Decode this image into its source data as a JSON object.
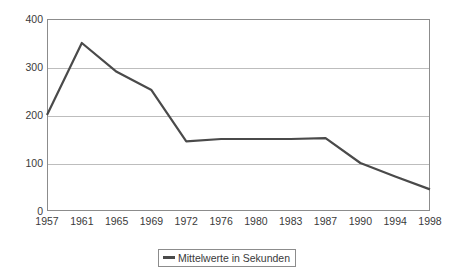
{
  "chart_data": {
    "type": "line",
    "title": "",
    "subtitle": "",
    "xlabel": "",
    "ylabel": "",
    "categories": [
      "1957",
      "1961",
      "1965",
      "1969",
      "1972",
      "1976",
      "1980",
      "1983",
      "1987",
      "1990",
      "1994",
      "1998"
    ],
    "series": [
      {
        "name": "Mittelwerte in Sekunden",
        "color": "#4a4a4a",
        "values": [
          200,
          350,
          290,
          252,
          145,
          150,
          150,
          150,
          152,
          100,
          72,
          45
        ]
      }
    ],
    "ylim": [
      0,
      400
    ],
    "yticks": [
      0,
      100,
      200,
      300,
      400
    ],
    "ytick_labels": [
      "0",
      "100",
      "200",
      "300",
      "400"
    ],
    "grid": true,
    "grid_axis": "y",
    "legend_position": "bottom",
    "legend": [
      "Mittelwerte in Sekunden"
    ],
    "plot_background": "#ffffff",
    "grid_color": "#bdbdbd",
    "frame_color": "#8c8c8c"
  },
  "legend": {
    "label": "Mittelwerte in Sekunden",
    "swatch_name": "line-swatch"
  }
}
